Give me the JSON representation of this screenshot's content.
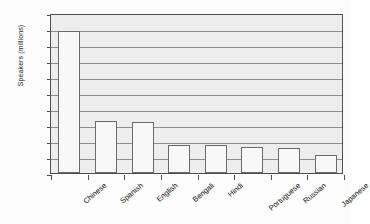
{
  "chart_data": {
    "type": "bar",
    "title": "",
    "xlabel": "",
    "ylabel": "Speakers (millions)",
    "categories": [
      "Chinese",
      "Spanish",
      "English",
      "Bengali",
      "Hindi",
      "Portuguese",
      "Russian",
      "Japanese"
    ],
    "values": [
      885,
      325,
      315,
      175,
      170,
      160,
      155,
      110
    ],
    "ylim": [
      0,
      1000
    ],
    "ytick_values": [
      0,
      100,
      200,
      300,
      400,
      500,
      600,
      700,
      800,
      900,
      1000
    ],
    "ytick_labels": [
      "0",
      "100",
      "200",
      "300",
      "400",
      "500",
      "600",
      "700",
      "800",
      "900",
      "1,000"
    ],
    "grid": "horizontal",
    "legend": "none",
    "series": [
      {
        "name": "Speakers",
        "values": [
          885,
          325,
          315,
          175,
          170,
          160,
          155,
          110
        ]
      }
    ],
    "colors": {
      "bar_fill": "#f8f8f8",
      "bar_border": "#6a6a6a",
      "plot_background": "#ededed",
      "plot_border": "#4d4d4d",
      "gridline": "#8d8d8d",
      "text": "#111111",
      "figure_background": "#fdfdfd"
    }
  }
}
